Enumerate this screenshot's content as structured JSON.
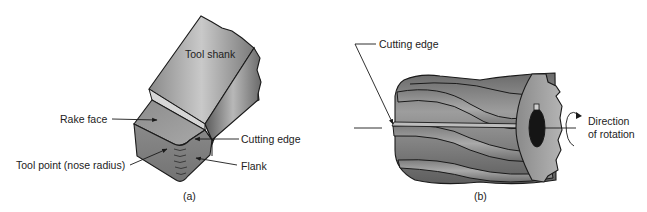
{
  "figure_a": {
    "caption": "(a)",
    "labels": {
      "tool_shank": "Tool shank",
      "rake_face": "Rake face",
      "cutting_edge": "Cutting edge",
      "tool_point": "Tool point (nose radius)",
      "flank": "Flank"
    }
  },
  "figure_b": {
    "caption": "(b)",
    "labels": {
      "cutting_edge": "Cutting edge",
      "direction_line1": "Direction",
      "direction_line2": "of rotation"
    }
  },
  "colors": {
    "metal_dark": "#6e6e6e",
    "metal_mid": "#9a9a9a",
    "metal_light": "#c8c8c8",
    "outline": "#1a1a1a",
    "bore": "#151515"
  }
}
